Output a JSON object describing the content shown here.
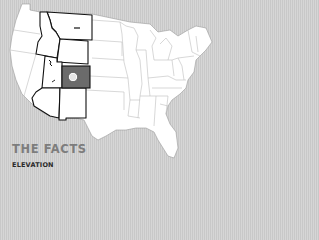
{
  "map": {
    "region": "United States",
    "highlighted_state": "Colorado",
    "outlined_states": [
      "Montana",
      "Idaho",
      "Wyoming",
      "Utah",
      "Colorado",
      "Arizona",
      "New Mexico"
    ],
    "colors": {
      "background": "#d2d2d2",
      "land": "#ffffff",
      "state_border": "#bdbdbd",
      "outlined_border": "#111111",
      "highlight_fill": "#6b6b6b",
      "marker_fill": "#ffffff"
    },
    "marker": {
      "icon": "location-circle-icon",
      "state": "Colorado"
    }
  },
  "facts": {
    "title": "THE FACTS",
    "section": "ELEVATION"
  }
}
